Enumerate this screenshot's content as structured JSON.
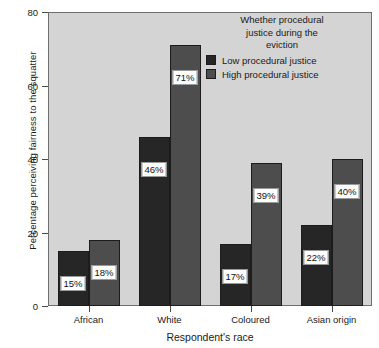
{
  "chart_data": {
    "type": "bar",
    "title": "",
    "xlabel": "Respondent's race",
    "ylabel": "Percentage perceiving fairness to the squatter",
    "categories": [
      "African",
      "White",
      "Coloured",
      "Asian origin"
    ],
    "series": [
      {
        "name": "Low procedural justice",
        "color": "#262626",
        "values": [
          15,
          46,
          17,
          22
        ],
        "labels": [
          "15%",
          "46%",
          "17%",
          "22%"
        ]
      },
      {
        "name": "High procedural justice",
        "color": "#4d4d4d",
        "values": [
          18,
          71,
          39,
          40
        ],
        "labels": [
          "18%",
          "71%",
          "39%",
          "40%"
        ]
      }
    ],
    "ylim": [
      0,
      80
    ],
    "yticks": [
      0,
      20,
      40,
      60,
      80
    ],
    "ytick_labels": [
      "0",
      "20",
      "40",
      "60",
      "80"
    ],
    "grid": false,
    "legend_position": "top-right",
    "legend_title": "Whether procedural justice during the eviction",
    "legend_title_lines": [
      "Whether procedural",
      "justice during the",
      "eviction"
    ],
    "plot_background": "#d4d4d4",
    "figure_background": "#ffffff"
  }
}
